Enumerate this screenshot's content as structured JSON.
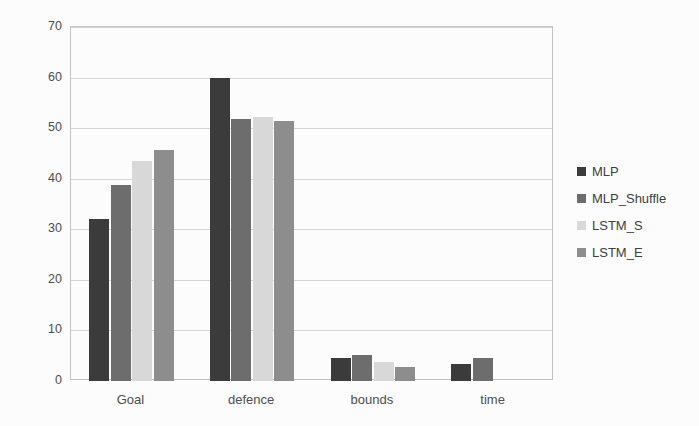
{
  "chart_data": {
    "type": "bar",
    "title": "",
    "xlabel": "",
    "ylabel": "",
    "categories": [
      "Goal",
      "defence",
      "bounds",
      "time"
    ],
    "series": [
      {
        "name": "MLP",
        "color": "#3b3b3b",
        "values": [
          32,
          60,
          4.6,
          3.3
        ]
      },
      {
        "name": "MLP_Shuffle",
        "color": "#6d6d6d",
        "values": [
          38.7,
          51.8,
          5.2,
          4.5
        ]
      },
      {
        "name": "LSTM_S",
        "color": "#d8d8d8",
        "values": [
          43.6,
          52.3,
          3.7,
          0
        ]
      },
      {
        "name": "LSTM_E",
        "color": "#8d8d8d",
        "values": [
          45.7,
          51.4,
          2.8,
          0
        ]
      }
    ],
    "ylim": [
      0,
      70
    ],
    "yticks": [
      0,
      10,
      20,
      30,
      40,
      50,
      60,
      70
    ],
    "grid": true,
    "legend_position": "right"
  },
  "colors": {
    "gridline": "#d5d5d5",
    "plot_border": "#c2c2c2",
    "axis_text": "#4d4d4d",
    "legend_text": "#404040",
    "background": "#fcfcfc"
  }
}
